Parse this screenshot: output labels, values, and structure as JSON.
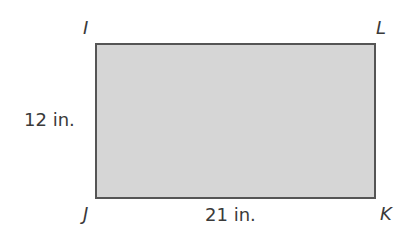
{
  "diagram": {
    "type": "rectangle",
    "fill_color": "#d6d6d6",
    "stroke_color": "#555555",
    "vertices": {
      "top_left": "I",
      "top_right": "L",
      "bottom_left": "J",
      "bottom_right": "K"
    },
    "dimensions": {
      "height_label": "12 in.",
      "width_label": "21 in."
    }
  }
}
